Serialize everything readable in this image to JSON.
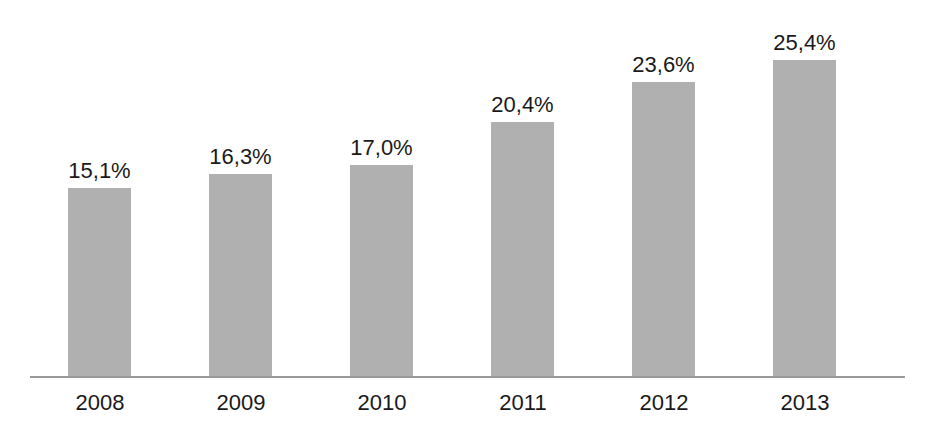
{
  "chart_data": {
    "type": "bar",
    "title": "",
    "subtitle": "",
    "xlabel": "",
    "ylabel": "",
    "categories": [
      "2008",
      "2009",
      "2010",
      "2011",
      "2012",
      "2013"
    ],
    "values": [
      15.1,
      16.3,
      17.0,
      20.4,
      23.6,
      25.4
    ],
    "value_labels": [
      "15,1%",
      "16,3%",
      "17,0%",
      "20,4%",
      "23,6%",
      "25,4%"
    ],
    "ylim": [
      0,
      30.2
    ],
    "grid": false,
    "legend": null,
    "y_axis_visible": false,
    "x_axis_visible": true,
    "annotations": [],
    "colors": {
      "bar_fill": "#b0b0b0",
      "axis_line": "#9a9a9a",
      "label_text": "#1a1a1a",
      "background": "#ffffff"
    }
  }
}
